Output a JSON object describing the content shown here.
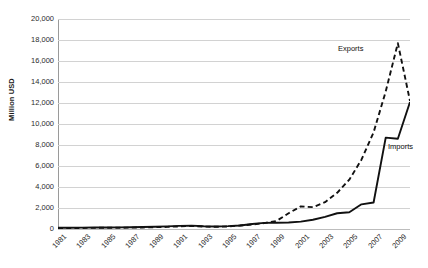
{
  "chart_data": {
    "type": "line",
    "title": "",
    "xlabel": "",
    "ylabel": "Million USD",
    "ylim": [
      0,
      20000
    ],
    "ytick_values": [
      0,
      2000,
      4000,
      6000,
      8000,
      10000,
      12000,
      14000,
      16000,
      18000,
      20000
    ],
    "ytick_labels": [
      "0",
      "2,000",
      "4,000",
      "6,000",
      "8,000",
      "10,000",
      "12,000",
      "14,000",
      "16,000",
      "18,000",
      "20,000"
    ],
    "grid": true,
    "legend_position": "inline-annotation",
    "x": [
      1981,
      1982,
      1983,
      1984,
      1985,
      1986,
      1987,
      1988,
      1989,
      1990,
      1991,
      1992,
      1993,
      1994,
      1995,
      1996,
      1997,
      1998,
      1999,
      2000,
      2001,
      2002,
      2003,
      2004,
      2005,
      2006,
      2007,
      2008,
      2009,
      2010
    ],
    "xtick_labels": [
      "1981",
      "1983",
      "1985",
      "1987",
      "1989",
      "1991",
      "1993",
      "1995",
      "1997",
      "1999",
      "2001",
      "2003",
      "2005",
      "2007",
      "2009"
    ],
    "xtick_values": [
      1981,
      1983,
      1985,
      1987,
      1989,
      1991,
      1993,
      1995,
      1997,
      1999,
      2001,
      2003,
      2005,
      2007,
      2009
    ],
    "series": [
      {
        "name": "Exports",
        "style": "dashed",
        "color": "#111111",
        "label": "Exports",
        "values": [
          90,
          95,
          100,
          110,
          115,
          120,
          130,
          150,
          175,
          200,
          250,
          300,
          230,
          215,
          235,
          340,
          430,
          560,
          760,
          1500,
          2150,
          2080,
          2550,
          3450,
          4700,
          6600,
          9200,
          13100,
          17700,
          12200
        ]
      },
      {
        "name": "Imports",
        "style": "solid",
        "color": "#111111",
        "label": "Imports",
        "values": [
          120,
          125,
          130,
          140,
          150,
          155,
          165,
          185,
          215,
          250,
          300,
          320,
          260,
          245,
          270,
          330,
          470,
          580,
          600,
          620,
          700,
          880,
          1150,
          1500,
          1600,
          2350,
          2520,
          8700,
          8600,
          12100
        ]
      }
    ],
    "annotations": [
      {
        "text": "Exports",
        "series": "Exports"
      },
      {
        "text": "Imports",
        "series": "Imports"
      }
    ]
  }
}
